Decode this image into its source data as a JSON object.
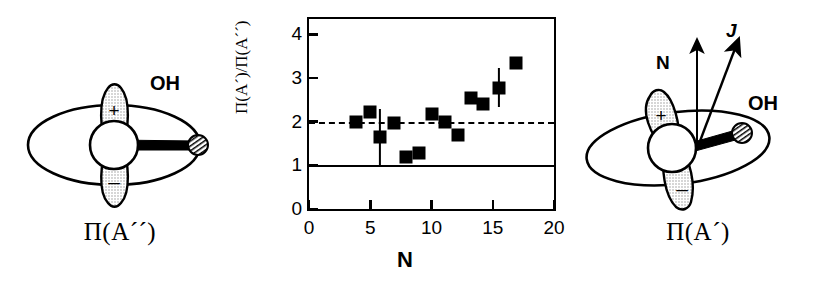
{
  "figure": {
    "panels": [
      {
        "id": "left",
        "caption": "Π(A´´)",
        "molecule_label": "OH"
      },
      {
        "id": "right",
        "caption": "Π(A´)",
        "molecule_label": "OH"
      }
    ]
  },
  "left_diagram": {
    "caption": "Π(A´´)",
    "molecule_label": "OH",
    "lobe_plus_label": "+",
    "lobe_minus_label": "–"
  },
  "right_diagram": {
    "caption": "Π(A´)",
    "molecule_label": "OH",
    "lobe_plus_label": "+",
    "lobe_minus_label": "–",
    "vector_n_label": "N",
    "vector_j_label": "J"
  },
  "chart_data": {
    "type": "scatter",
    "title": "",
    "xlabel": "N",
    "ylabel": "Π(A´)/Π(A´´)",
    "xlim": [
      0,
      20
    ],
    "ylim": [
      0,
      4.35
    ],
    "xticks": [
      0,
      5,
      10,
      15,
      20
    ],
    "xtick_labels": [
      "0",
      "5",
      "10",
      "15",
      "20"
    ],
    "yticks": [
      0,
      1,
      2,
      3,
      4
    ],
    "ytick_labels": [
      "0",
      "1",
      "2",
      "3",
      "4"
    ],
    "grid": false,
    "legend": null,
    "reference_lines": [
      {
        "y": 1,
        "style": "solid",
        "color": "#000000"
      },
      {
        "y": 2,
        "style": "dashed",
        "color": "#000000"
      }
    ],
    "series": [
      {
        "name": "Π(A´)/Π(A´´)",
        "marker": "square",
        "color": "#000000",
        "points": [
          {
            "x": 3.8,
            "y": 2.0,
            "yerr": 0
          },
          {
            "x": 5.0,
            "y": 2.22,
            "yerr": 0
          },
          {
            "x": 5.8,
            "y": 1.65,
            "yerr": 0.65
          },
          {
            "x": 6.9,
            "y": 1.98,
            "yerr": 0
          },
          {
            "x": 7.9,
            "y": 1.18,
            "yerr": 0
          },
          {
            "x": 9.0,
            "y": 1.29,
            "yerr": 0
          },
          {
            "x": 10.0,
            "y": 2.17,
            "yerr": 0
          },
          {
            "x": 11.1,
            "y": 2.0,
            "yerr": 0
          },
          {
            "x": 12.2,
            "y": 1.69,
            "yerr": 0
          },
          {
            "x": 13.2,
            "y": 2.55,
            "yerr": 0
          },
          {
            "x": 14.2,
            "y": 2.4,
            "yerr": 0
          },
          {
            "x": 15.5,
            "y": 2.78,
            "yerr": 0.45
          },
          {
            "x": 16.9,
            "y": 3.35,
            "yerr": 0
          }
        ]
      }
    ]
  }
}
